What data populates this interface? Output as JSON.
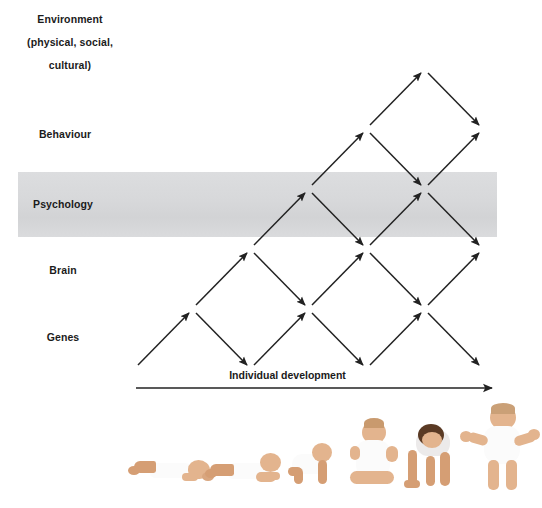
{
  "figure": {
    "type": "diagram"
  },
  "levels": [
    {
      "id": "environment",
      "label": "Environment\n(physical, social,\ncultural)",
      "highlighted": false
    },
    {
      "id": "behaviour",
      "label": "Behaviour",
      "highlighted": false
    },
    {
      "id": "psychology",
      "label": "Psychology",
      "highlighted": true
    },
    {
      "id": "brain",
      "label": "Brain",
      "highlighted": false
    },
    {
      "id": "genes",
      "label": "Genes",
      "highlighted": false
    }
  ],
  "highlight_band": {
    "level": "psychology",
    "color": "#d7d8da"
  },
  "axis": {
    "label": "Individual development",
    "direction": "left-to-right",
    "arrowhead": "right"
  },
  "arrows": {
    "color": "#222222",
    "style": "zigzag-lattice",
    "description": "Alternating up-right and down-right arrows linking adjacent levels, ascending from Genes to Environment across developmental time."
  },
  "photo_strip": {
    "caption": "",
    "stages": [
      {
        "index": 1,
        "pose": "lying prone"
      },
      {
        "index": 2,
        "pose": "lying, lifting head"
      },
      {
        "index": 3,
        "pose": "crawling"
      },
      {
        "index": 4,
        "pose": "sitting upright"
      },
      {
        "index": 5,
        "pose": "squatting on hands and feet"
      },
      {
        "index": 6,
        "pose": "standing"
      }
    ]
  },
  "colors": {
    "band": "#d7d8da",
    "ink": "#1b1b1b",
    "arrow": "#222222",
    "background": "#ffffff"
  }
}
